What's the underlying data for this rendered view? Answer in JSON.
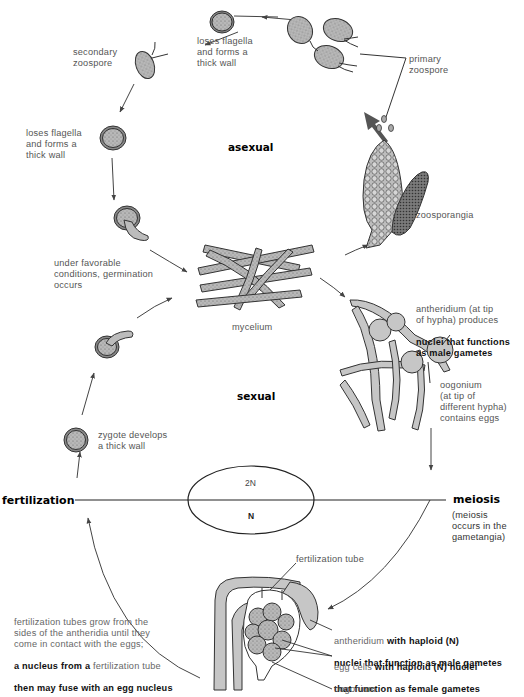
{
  "diagram": {
    "phases": {
      "asexual": "asexual",
      "sexual": "sexual"
    },
    "events": {
      "fertilization": "fertilization",
      "meiosis": "meiosis",
      "meiosis_note": "(meiosis\noccurs in the\ngametangia)"
    },
    "ploidy": {
      "upper": "2N",
      "lower": "N"
    },
    "labels": {
      "loses_flagella_top": "loses flagella\nand forms a\nthick wall",
      "secondary_zoospore": "secondary\nzoospore",
      "loses_flagella_left": "loses flagella\nand forms a\nthick wall",
      "primary_zoospore": "primary\nzoospore",
      "zoosporangia": "zoosporangia",
      "germination": "under favorable\nconditions, germination\noccurs",
      "mycelium": "mycelium",
      "antheridium_tip_part1": "antheridium (at tip\nof hypha) produces",
      "antheridium_tip_part2": "nuclei that functions\nas male gametes",
      "oogonium_tip": "oogonium\n(at tip of\ndifferent hypha)\ncontains eggs",
      "zygote": "zygote develops\na thick wall",
      "fertilization_tube": "fertilization tube",
      "fert_tubes_part1": "fertilization tubes grow from the\nsides of the antheridia until they\ncome in contact with the eggs;",
      "fert_tubes_part2a": "a nucleus from a",
      "fert_tubes_part2b": " fertilization tube",
      "fert_tubes_part3": "then may fuse with an egg nucleus",
      "antheridium_haploid_a": "antheridium",
      "antheridium_haploid_b": " with haploid (N)",
      "antheridium_haploid_c": "nuclei that function as male gametes",
      "egg_cells_a": "egg cells",
      "egg_cells_b": " with haploid (N) nuclei",
      "egg_cells_c": "that function as female gametes",
      "oogonium_bottom": "oogonium"
    },
    "colors": {
      "hypha_fill": "#c9c9c9",
      "outline": "#333333",
      "arrow": "#444444",
      "bold_arrow": "#555555"
    }
  }
}
